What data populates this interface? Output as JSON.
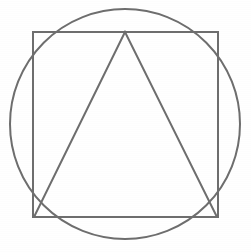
{
  "canvas": {
    "width": 251,
    "height": 252,
    "background_color": "#ffffff",
    "description": "Line drawing of a circle with an inscribed square and an inscribed triangle"
  },
  "style": {
    "stroke_color": "#6e6e6e",
    "stroke_width": 2,
    "fill": "none"
  },
  "shapes": [
    {
      "name": "circle",
      "type": "circle",
      "label": "Circumscribed circle",
      "center_x": 125,
      "center_y": 124,
      "radius": 115,
      "stroke_color": "#6e6e6e",
      "stroke_width": 2
    },
    {
      "name": "square",
      "type": "square",
      "label": "Inscribed square",
      "x": 33,
      "y": 32,
      "width": 185,
      "height": 185,
      "corner_top_left_x": 33,
      "corner_top_left_y": 32,
      "corner_top_right_x": 218,
      "corner_top_right_y": 32,
      "corner_bottom_right_x": 218,
      "corner_bottom_right_y": 217,
      "corner_bottom_left_x": 33,
      "corner_bottom_left_y": 217,
      "stroke_color": "#6e6e6e",
      "stroke_width": 2
    },
    {
      "name": "triangle",
      "type": "triangle",
      "label": "Inscribed isosceles triangle",
      "apex_x": 125,
      "apex_y": 32,
      "base_left_x": 34,
      "base_left_y": 217,
      "base_right_x": 217,
      "base_right_y": 217,
      "points": "125,32 34,217 217,217",
      "stroke_color": "#6e6e6e",
      "stroke_width": 2
    }
  ]
}
